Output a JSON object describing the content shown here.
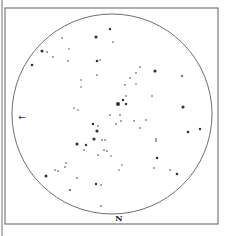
{
  "map": {
    "type": "star-chart",
    "frame": {
      "x": 5,
      "y": 8,
      "width": 213,
      "height": 216,
      "color": "#7a7a7a"
    },
    "outer_left_rule": {
      "x": 2,
      "y1": 0,
      "y2": 236,
      "color": "#8a8a8a"
    },
    "horizon_circle": {
      "cx": 112,
      "cy": 114,
      "r": 100,
      "color": "#6e6e6e"
    },
    "labels": {
      "north": {
        "text": "N",
        "x": 119,
        "y": 218
      },
      "direction_arrow": {
        "text": "←",
        "x": 22,
        "y": 117
      }
    },
    "star_color": "#333333",
    "stars": [
      [
        96,
        37,
        1.6
      ],
      [
        110,
        29,
        1.2
      ],
      [
        62,
        38,
        0.8
      ],
      [
        42,
        51,
        1.5
      ],
      [
        47,
        52,
        0.8
      ],
      [
        53,
        57,
        0.8
      ],
      [
        32,
        65,
        1.3
      ],
      [
        68,
        61,
        0.8
      ],
      [
        97,
        61,
        1.3
      ],
      [
        100,
        60,
        0.7
      ],
      [
        97,
        75,
        0.8
      ],
      [
        81,
        80,
        0.7
      ],
      [
        81,
        87,
        0.7
      ],
      [
        74,
        108,
        0.7
      ],
      [
        78,
        110,
        0.7
      ],
      [
        69,
        49,
        0.7
      ],
      [
        113,
        42,
        0.8
      ],
      [
        140,
        67,
        0.8
      ],
      [
        155,
        71,
        1.6
      ],
      [
        136,
        73,
        0.8
      ],
      [
        130,
        78,
        0.8
      ],
      [
        125,
        85,
        0.8
      ],
      [
        152,
        96,
        0.8
      ],
      [
        182,
        76,
        0.9
      ],
      [
        183,
        107,
        1.6
      ],
      [
        136,
        84,
        0.7
      ],
      [
        123,
        100,
        1.3
      ],
      [
        118,
        104,
        2.0
      ],
      [
        126,
        104,
        1.2
      ],
      [
        126,
        96,
        0.8
      ],
      [
        120,
        115,
        0.8
      ],
      [
        116,
        124,
        0.8
      ],
      [
        121,
        121,
        0.8
      ],
      [
        93,
        124,
        1.3
      ],
      [
        98,
        126,
        0.8
      ],
      [
        97,
        131,
        1.6
      ],
      [
        94,
        139,
        1.6
      ],
      [
        102,
        140,
        0.8
      ],
      [
        110,
        115,
        0.8
      ],
      [
        105,
        140,
        0.8
      ],
      [
        86,
        145,
        1.2
      ],
      [
        104,
        150,
        0.8
      ],
      [
        107,
        151,
        0.8
      ],
      [
        98,
        155,
        0.8
      ],
      [
        140,
        128,
        0.8
      ],
      [
        134,
        121,
        0.8
      ],
      [
        146,
        120,
        0.8
      ],
      [
        188,
        132,
        1.3
      ],
      [
        200,
        129,
        1.2
      ],
      [
        156,
        141,
        0.8
      ],
      [
        156,
        139,
        0.8
      ],
      [
        157,
        158,
        1.3
      ],
      [
        154,
        168,
        0.8
      ],
      [
        170,
        170,
        0.8
      ],
      [
        177,
        174,
        1.3
      ],
      [
        77,
        144,
        1.6
      ],
      [
        84,
        150,
        0.8
      ],
      [
        66,
        163,
        0.8
      ],
      [
        55,
        170,
        0.8
      ],
      [
        58,
        171,
        0.8
      ],
      [
        65,
        167,
        0.8
      ],
      [
        46,
        176,
        1.5
      ],
      [
        70,
        190,
        0.9
      ],
      [
        96,
        184,
        1.2
      ],
      [
        101,
        185,
        0.8
      ],
      [
        101,
        206,
        0.8
      ],
      [
        77,
        178,
        0.8
      ],
      [
        111,
        156,
        0.7
      ],
      [
        122,
        165,
        0.7
      ],
      [
        119,
        170,
        0.7
      ]
    ]
  }
}
